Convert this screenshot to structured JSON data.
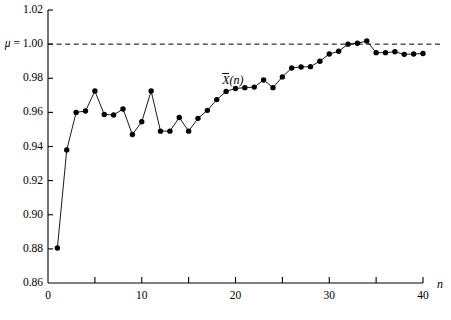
{
  "chart_data": {
    "type": "line",
    "title": "",
    "xlabel": "n",
    "ylabel": "",
    "xlim": [
      0,
      40
    ],
    "ylim": [
      0.86,
      1.02
    ],
    "grid": false,
    "legend": "none",
    "x_ticks_major": [
      0,
      10,
      20,
      30,
      40
    ],
    "x_ticks_minor": [
      5,
      15,
      25,
      35
    ],
    "x_tick_labels": [
      "0",
      "10",
      "20",
      "30",
      "40"
    ],
    "y_ticks": [
      0.86,
      0.88,
      0.9,
      0.92,
      0.94,
      0.96,
      0.98,
      1.0,
      1.02
    ],
    "y_tick_labels": [
      "0.86",
      "0.88",
      "0.90",
      "0.92",
      "0.94",
      "0.96",
      "0.98",
      "1.00",
      "1.02"
    ],
    "y_tick_labels_shown": [
      "0.88",
      "0.90",
      "0.92",
      "0.94",
      "0.96",
      "0.98",
      "1.02"
    ],
    "reference_line": {
      "label": "μ = 1.00",
      "value": 1.0,
      "style": "dashed"
    },
    "series": [
      {
        "name": "X̄(n)",
        "marker": "filled-circle",
        "color": "#000000",
        "x": [
          1,
          2,
          3,
          4,
          5,
          6,
          7,
          8,
          9,
          10,
          11,
          12,
          13,
          14,
          15,
          16,
          17,
          18,
          19,
          20,
          21,
          22,
          23,
          24,
          25,
          26,
          27,
          28,
          29,
          30,
          31,
          32,
          33,
          34,
          35,
          36,
          37,
          38,
          39,
          40
        ],
        "values": [
          0.8805,
          0.938,
          0.96,
          0.9608,
          0.9725,
          0.9588,
          0.9585,
          0.962,
          0.947,
          0.9545,
          0.9725,
          0.949,
          0.949,
          0.957,
          0.949,
          0.9565,
          0.9612,
          0.9675,
          0.9723,
          0.974,
          0.9745,
          0.9748,
          0.979,
          0.9745,
          0.9808,
          0.986,
          0.9866,
          0.9868,
          0.99,
          0.9942,
          0.9958,
          1.0,
          1.0005,
          1.0018,
          0.995,
          0.995,
          0.9955,
          0.994,
          0.9942,
          0.9945
        ]
      }
    ],
    "annotations": [
      {
        "text": "X̄(n)",
        "x": 20.5,
        "y": 0.9785,
        "role": "series-label"
      },
      {
        "text": "μ = 1.00",
        "x": -5.0,
        "y": 1.0,
        "role": "reference-label"
      },
      {
        "text": "n",
        "x": 41.5,
        "y": 0.855,
        "role": "axis-name"
      }
    ]
  },
  "axis": {
    "x_name": "n",
    "mu_label_mu": "μ",
    "mu_label_eq": " = 1.00",
    "series_label_main": "X",
    "series_label_paren": "(n)"
  }
}
